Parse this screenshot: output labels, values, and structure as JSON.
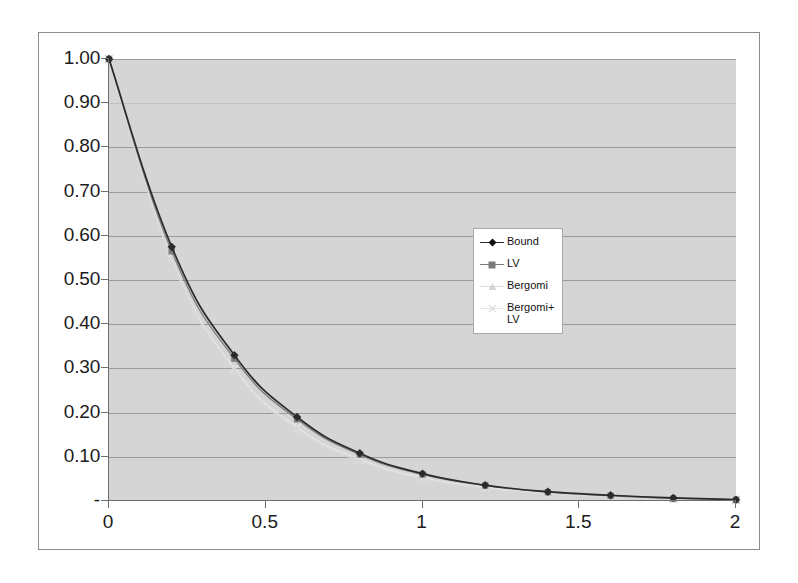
{
  "chart_data": {
    "type": "line",
    "title": "",
    "xlabel": "",
    "ylabel": "",
    "xlim": [
      0,
      2
    ],
    "ylim": [
      0,
      1.0
    ],
    "grid": true,
    "legend_position": "inside-right-middle",
    "x_ticks": [
      "0",
      "0.5",
      "1",
      "1.5",
      "2"
    ],
    "x_tick_values": [
      0,
      0.5,
      1,
      1.5,
      2
    ],
    "y_ticks": [
      "-",
      "0.10",
      "0.20",
      "0.30",
      "0.40",
      "0.50",
      "0.60",
      "0.70",
      "0.80",
      "0.90",
      "1.00"
    ],
    "y_tick_values": [
      0,
      0.1,
      0.2,
      0.3,
      0.4,
      0.5,
      0.6,
      0.7,
      0.8,
      0.9,
      1.0
    ],
    "x": [
      0,
      0.2,
      0.4,
      0.6,
      0.8,
      1.0,
      1.2,
      1.4,
      1.6,
      1.8,
      2.0
    ],
    "series": [
      {
        "name": "Bound",
        "color": "#2b2b2b",
        "marker": "diamond",
        "values": [
          1.0,
          0.575,
          0.33,
          0.19,
          0.108,
          0.062,
          0.036,
          0.021,
          0.013,
          0.007,
          0.003
        ]
      },
      {
        "name": "LV",
        "color": "#7d7d7d",
        "marker": "square",
        "values": [
          1.0,
          0.565,
          0.322,
          0.185,
          0.105,
          0.06,
          0.035,
          0.02,
          0.012,
          0.006,
          0.003
        ]
      },
      {
        "name": "Bergomi",
        "color": "#d8d8d8",
        "marker": "triangle",
        "values": [
          1.0,
          0.545,
          0.295,
          0.162,
          0.09,
          0.05,
          0.028,
          0.016,
          0.009,
          0.005,
          0.002
        ]
      },
      {
        "name": "Bergomi+LV",
        "color": "#e6e6e6",
        "marker": "cross",
        "values": [
          1.0,
          0.548,
          0.3,
          0.167,
          0.094,
          0.053,
          0.03,
          0.017,
          0.01,
          0.005,
          0.002
        ]
      }
    ]
  },
  "legend": {
    "items": [
      {
        "label": "Bound"
      },
      {
        "label": "LV"
      },
      {
        "label": "Bergomi"
      },
      {
        "label": "Bergomi+LV"
      }
    ]
  },
  "colors": {
    "plot_background": "#d5d5d5",
    "frame_background": "#ffffff",
    "gridline": "#9a9a9a",
    "axis": "#6e6e6e",
    "text": "#1b1b1b"
  }
}
